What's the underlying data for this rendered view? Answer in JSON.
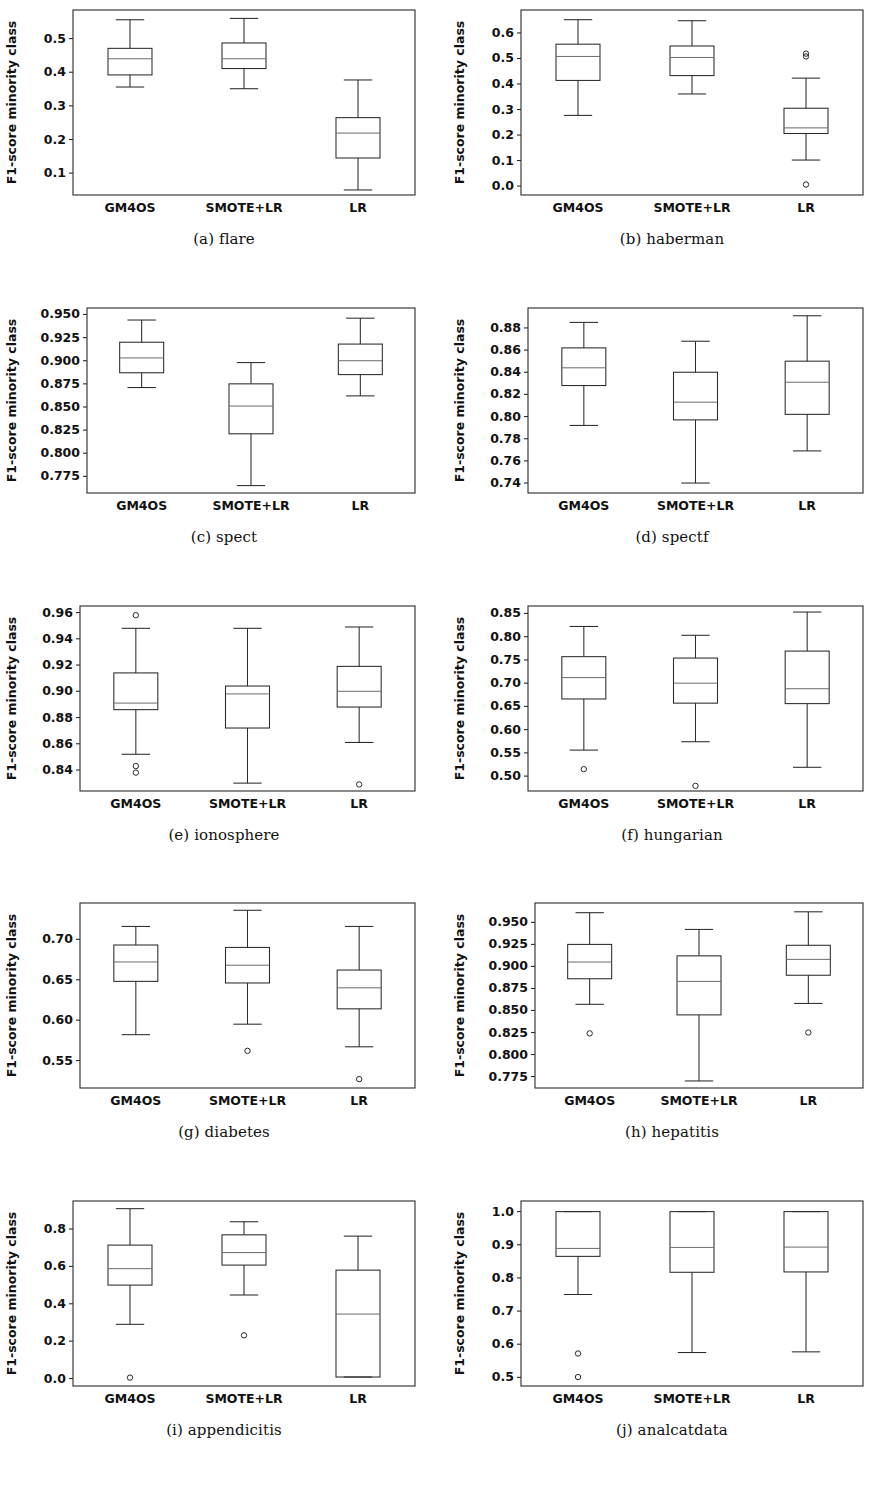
{
  "figure": {
    "ylabel": "F1-score minority class",
    "categories": [
      "GM4OS",
      "SMOTE+LR",
      "LR"
    ]
  },
  "chart_data": [
    {
      "type": "boxplot",
      "panel": "a",
      "caption": "(a) flare",
      "title": "",
      "xlabel": "",
      "ylabel": "F1-score minority class",
      "categories": [
        "GM4OS",
        "SMOTE+LR",
        "LR"
      ],
      "ylim": [
        0.035,
        0.585
      ],
      "yticks": [
        0.1,
        0.2,
        0.3,
        0.4,
        0.5
      ],
      "ytick_labels": [
        "0.1",
        "0.2",
        "0.3",
        "0.4",
        "0.5"
      ],
      "grid": false,
      "legend": "none",
      "boxes": [
        {
          "name": "GM4OS",
          "whislo": 0.356,
          "q1": 0.392,
          "med": 0.44,
          "q3": 0.471,
          "whishi": 0.556,
          "fliers": []
        },
        {
          "name": "SMOTE+LR",
          "whislo": 0.351,
          "q1": 0.411,
          "med": 0.44,
          "q3": 0.487,
          "whishi": 0.56,
          "fliers": []
        },
        {
          "name": "LR",
          "whislo": 0.05,
          "q1": 0.145,
          "med": 0.219,
          "q3": 0.265,
          "whishi": 0.377,
          "fliers": []
        }
      ]
    },
    {
      "type": "boxplot",
      "panel": "b",
      "caption": "(b) haberman",
      "title": "",
      "xlabel": "",
      "ylabel": "F1-score minority class",
      "categories": [
        "GM4OS",
        "SMOTE+LR",
        "LR"
      ],
      "ylim": [
        -0.035,
        0.69
      ],
      "yticks": [
        0.0,
        0.1,
        0.2,
        0.3,
        0.4,
        0.5,
        0.6
      ],
      "ytick_labels": [
        "0.0",
        "0.1",
        "0.2",
        "0.3",
        "0.4",
        "0.5",
        "0.6"
      ],
      "grid": false,
      "legend": "none",
      "boxes": [
        {
          "name": "GM4OS",
          "whislo": 0.277,
          "q1": 0.414,
          "med": 0.508,
          "q3": 0.556,
          "whishi": 0.652,
          "fliers": []
        },
        {
          "name": "SMOTE+LR",
          "whislo": 0.361,
          "q1": 0.433,
          "med": 0.504,
          "q3": 0.549,
          "whishi": 0.648,
          "fliers": []
        },
        {
          "name": "LR",
          "whislo": 0.102,
          "q1": 0.206,
          "med": 0.228,
          "q3": 0.305,
          "whishi": 0.423,
          "fliers": [
            0.519,
            0.508,
            0.006
          ]
        }
      ]
    },
    {
      "type": "boxplot",
      "panel": "c",
      "caption": "(c) spect",
      "title": "",
      "xlabel": "",
      "ylabel": "F1-score minority class",
      "categories": [
        "GM4OS",
        "SMOTE+LR",
        "LR"
      ],
      "ylim": [
        0.757,
        0.957
      ],
      "yticks": [
        0.775,
        0.8,
        0.825,
        0.85,
        0.875,
        0.9,
        0.925,
        0.95
      ],
      "ytick_labels": [
        "0.775",
        "0.800",
        "0.825",
        "0.850",
        "0.875",
        "0.900",
        "0.925",
        "0.950"
      ],
      "grid": false,
      "legend": "none",
      "boxes": [
        {
          "name": "GM4OS",
          "whislo": 0.871,
          "q1": 0.887,
          "med": 0.903,
          "q3": 0.92,
          "whishi": 0.944,
          "fliers": []
        },
        {
          "name": "SMOTE+LR",
          "whislo": 0.765,
          "q1": 0.821,
          "med": 0.851,
          "q3": 0.875,
          "whishi": 0.898,
          "fliers": []
        },
        {
          "name": "LR",
          "whislo": 0.862,
          "q1": 0.885,
          "med": 0.9,
          "q3": 0.918,
          "whishi": 0.946,
          "fliers": []
        }
      ]
    },
    {
      "type": "boxplot",
      "panel": "d",
      "caption": "(d) spectf",
      "title": "",
      "xlabel": "",
      "ylabel": "F1-score minority class",
      "categories": [
        "GM4OS",
        "SMOTE+LR",
        "LR"
      ],
      "ylim": [
        0.731,
        0.898
      ],
      "yticks": [
        0.74,
        0.76,
        0.78,
        0.8,
        0.82,
        0.84,
        0.86,
        0.88
      ],
      "ytick_labels": [
        "0.74",
        "0.76",
        "0.78",
        "0.80",
        "0.82",
        "0.84",
        "0.86",
        "0.88"
      ],
      "grid": false,
      "legend": "none",
      "boxes": [
        {
          "name": "GM4OS",
          "whislo": 0.792,
          "q1": 0.828,
          "med": 0.844,
          "q3": 0.862,
          "whishi": 0.885,
          "fliers": []
        },
        {
          "name": "SMOTE+LR",
          "whislo": 0.74,
          "q1": 0.797,
          "med": 0.813,
          "q3": 0.84,
          "whishi": 0.868,
          "fliers": []
        },
        {
          "name": "LR",
          "whislo": 0.769,
          "q1": 0.802,
          "med": 0.831,
          "q3": 0.85,
          "whishi": 0.891,
          "fliers": []
        }
      ]
    },
    {
      "type": "boxplot",
      "panel": "e",
      "caption": "(e) ionosphere",
      "title": "",
      "xlabel": "",
      "ylabel": "F1-score minority class",
      "categories": [
        "GM4OS",
        "SMOTE+LR",
        "LR"
      ],
      "ylim": [
        0.824,
        0.965
      ],
      "yticks": [
        0.84,
        0.86,
        0.88,
        0.9,
        0.92,
        0.94,
        0.96
      ],
      "ytick_labels": [
        "0.84",
        "0.86",
        "0.88",
        "0.90",
        "0.92",
        "0.94",
        "0.96"
      ],
      "grid": false,
      "legend": "none",
      "boxes": [
        {
          "name": "GM4OS",
          "whislo": 0.852,
          "q1": 0.886,
          "med": 0.891,
          "q3": 0.914,
          "whishi": 0.948,
          "fliers": [
            0.958,
            0.843,
            0.838
          ]
        },
        {
          "name": "SMOTE+LR",
          "whislo": 0.83,
          "q1": 0.872,
          "med": 0.898,
          "q3": 0.904,
          "whishi": 0.948,
          "fliers": []
        },
        {
          "name": "LR",
          "whislo": 0.861,
          "q1": 0.888,
          "med": 0.9,
          "q3": 0.919,
          "whishi": 0.949,
          "fliers": [
            0.829
          ]
        }
      ]
    },
    {
      "type": "boxplot",
      "panel": "f",
      "caption": "(f) hungarian",
      "title": "",
      "xlabel": "",
      "ylabel": "F1-score minority class",
      "categories": [
        "GM4OS",
        "SMOTE+LR",
        "LR"
      ],
      "ylim": [
        0.468,
        0.866
      ],
      "yticks": [
        0.5,
        0.55,
        0.6,
        0.65,
        0.7,
        0.75,
        0.8,
        0.85
      ],
      "ytick_labels": [
        "0.50",
        "0.55",
        "0.60",
        "0.65",
        "0.70",
        "0.75",
        "0.80",
        "0.85"
      ],
      "grid": false,
      "legend": "none",
      "boxes": [
        {
          "name": "GM4OS",
          "whislo": 0.556,
          "q1": 0.666,
          "med": 0.712,
          "q3": 0.757,
          "whishi": 0.822,
          "fliers": [
            0.515
          ]
        },
        {
          "name": "SMOTE+LR",
          "whislo": 0.574,
          "q1": 0.657,
          "med": 0.7,
          "q3": 0.754,
          "whishi": 0.803,
          "fliers": [
            0.479
          ]
        },
        {
          "name": "LR",
          "whislo": 0.519,
          "q1": 0.656,
          "med": 0.688,
          "q3": 0.769,
          "whishi": 0.853,
          "fliers": []
        }
      ]
    },
    {
      "type": "boxplot",
      "panel": "g",
      "caption": "(g) diabetes",
      "title": "",
      "xlabel": "",
      "ylabel": "F1-score minority class",
      "categories": [
        "GM4OS",
        "SMOTE+LR",
        "LR"
      ],
      "ylim": [
        0.516,
        0.745
      ],
      "yticks": [
        0.55,
        0.6,
        0.65,
        0.7
      ],
      "ytick_labels": [
        "0.55",
        "0.60",
        "0.65",
        "0.70"
      ],
      "grid": false,
      "legend": "none",
      "boxes": [
        {
          "name": "GM4OS",
          "whislo": 0.582,
          "q1": 0.648,
          "med": 0.672,
          "q3": 0.693,
          "whishi": 0.716,
          "fliers": []
        },
        {
          "name": "SMOTE+LR",
          "whislo": 0.595,
          "q1": 0.646,
          "med": 0.668,
          "q3": 0.69,
          "whishi": 0.736,
          "fliers": [
            0.562
          ]
        },
        {
          "name": "LR",
          "whislo": 0.567,
          "q1": 0.614,
          "med": 0.64,
          "q3": 0.662,
          "whishi": 0.716,
          "fliers": [
            0.527
          ]
        }
      ]
    },
    {
      "type": "boxplot",
      "panel": "h",
      "caption": "(h) hepatitis",
      "title": "",
      "xlabel": "",
      "ylabel": "F1-score minority class",
      "categories": [
        "GM4OS",
        "SMOTE+LR",
        "LR"
      ],
      "ylim": [
        0.762,
        0.972
      ],
      "yticks": [
        0.775,
        0.8,
        0.825,
        0.85,
        0.875,
        0.9,
        0.925,
        0.95
      ],
      "ytick_labels": [
        "0.775",
        "0.800",
        "0.825",
        "0.850",
        "0.875",
        "0.900",
        "0.925",
        "0.950"
      ],
      "grid": false,
      "legend": "none",
      "boxes": [
        {
          "name": "GM4OS",
          "whislo": 0.857,
          "q1": 0.886,
          "med": 0.905,
          "q3": 0.925,
          "whishi": 0.961,
          "fliers": [
            0.824
          ]
        },
        {
          "name": "SMOTE+LR",
          "whislo": 0.77,
          "q1": 0.845,
          "med": 0.883,
          "q3": 0.912,
          "whishi": 0.942,
          "fliers": []
        },
        {
          "name": "LR",
          "whislo": 0.858,
          "q1": 0.89,
          "med": 0.908,
          "q3": 0.924,
          "whishi": 0.962,
          "fliers": [
            0.825
          ]
        }
      ]
    },
    {
      "type": "boxplot",
      "panel": "i",
      "caption": "(i) appendicitis",
      "title": "",
      "xlabel": "",
      "ylabel": "F1-score minority class",
      "categories": [
        "GM4OS",
        "SMOTE+LR",
        "LR"
      ],
      "ylim": [
        -0.04,
        0.95
      ],
      "yticks": [
        0.0,
        0.2,
        0.4,
        0.6,
        0.8
      ],
      "ytick_labels": [
        "0.0",
        "0.2",
        "0.4",
        "0.6",
        "0.8"
      ],
      "grid": false,
      "legend": "none",
      "boxes": [
        {
          "name": "GM4OS",
          "whislo": 0.29,
          "q1": 0.5,
          "med": 0.588,
          "q3": 0.714,
          "whishi": 0.909,
          "fliers": [
            0.005
          ]
        },
        {
          "name": "SMOTE+LR",
          "whislo": 0.447,
          "q1": 0.607,
          "med": 0.674,
          "q3": 0.769,
          "whishi": 0.839,
          "fliers": [
            0.231
          ]
        },
        {
          "name": "LR",
          "whislo": 0.008,
          "q1": 0.008,
          "med": 0.345,
          "q3": 0.58,
          "whishi": 0.762,
          "fliers": []
        }
      ]
    },
    {
      "type": "boxplot",
      "panel": "j",
      "caption": "(j) analcatdata",
      "title": "",
      "xlabel": "",
      "ylabel": "F1-score minority class",
      "categories": [
        "GM4OS",
        "SMOTE+LR",
        "LR"
      ],
      "ylim": [
        0.474,
        1.032
      ],
      "yticks": [
        0.5,
        0.6,
        0.7,
        0.8,
        0.9,
        1.0
      ],
      "ytick_labels": [
        "0.5",
        "0.6",
        "0.7",
        "0.8",
        "0.9",
        "1.0"
      ],
      "grid": false,
      "legend": "none",
      "boxes": [
        {
          "name": "GM4OS",
          "whislo": 0.75,
          "q1": 0.865,
          "med": 0.889,
          "q3": 1.0,
          "whishi": 1.0,
          "fliers": [
            0.572,
            0.501
          ]
        },
        {
          "name": "SMOTE+LR",
          "whislo": 0.575,
          "q1": 0.817,
          "med": 0.892,
          "q3": 1.0,
          "whishi": 1.0,
          "fliers": []
        },
        {
          "name": "LR",
          "whislo": 0.577,
          "q1": 0.818,
          "med": 0.893,
          "q3": 1.0,
          "whishi": 1.0,
          "fliers": []
        }
      ]
    }
  ]
}
